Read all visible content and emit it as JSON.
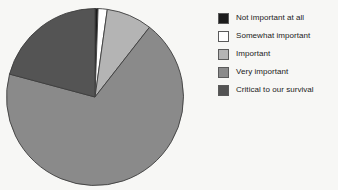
{
  "chart_data": {
    "type": "pie",
    "title": "",
    "subtitle": "",
    "xlabel": "",
    "ylabel": "",
    "grid": false,
    "legend_position": "right",
    "start_angle_deg": 0,
    "direction": "clockwise",
    "categories": [
      "Not important at all",
      "Somewhat important",
      "Important",
      "Very important",
      "Critical to our survival"
    ],
    "values": [
      0.6,
      1.7,
      8.3,
      68.6,
      20.8
    ],
    "value_unit": "percent",
    "angles_deg": [
      2,
      6,
      30,
      247,
      75
    ],
    "colors": [
      "#1c1c1c",
      "#ffffff",
      "#b4b4b4",
      "#8a8a8a",
      "#545454"
    ],
    "slices": [
      {
        "label": "Not important at all",
        "value": 0.6,
        "angle_deg": 2,
        "color": "#1c1c1c"
      },
      {
        "label": "Somewhat important",
        "value": 1.7,
        "angle_deg": 6,
        "color": "#ffffff"
      },
      {
        "label": "Important",
        "value": 8.3,
        "angle_deg": 30,
        "color": "#b4b4b4"
      },
      {
        "label": "Very important",
        "value": 68.6,
        "angle_deg": 247,
        "color": "#8a8a8a"
      },
      {
        "label": "Critical to our survival",
        "value": 20.8,
        "angle_deg": 75,
        "color": "#545454"
      }
    ]
  },
  "legend": {
    "items": [
      {
        "label": "Not important at all",
        "color": "#1c1c1c",
        "swatch_name": "legend-swatch-not-important-at-all"
      },
      {
        "label": "Somewhat important",
        "color": "#ffffff",
        "swatch_name": "legend-swatch-somewhat-important"
      },
      {
        "label": "Important",
        "color": "#b4b4b4",
        "swatch_name": "legend-swatch-important"
      },
      {
        "label": "Very important",
        "color": "#8a8a8a",
        "swatch_name": "legend-swatch-very-important"
      },
      {
        "label": "Critical to our survival",
        "color": "#545454",
        "swatch_name": "legend-swatch-critical-to-our-survival"
      }
    ]
  },
  "style": {
    "background": "#f7f7f5",
    "slice_outline": "#3d3d3d",
    "legend_swatch_outline": "#5a5a5a",
    "text_color": "#1b1b1b"
  }
}
